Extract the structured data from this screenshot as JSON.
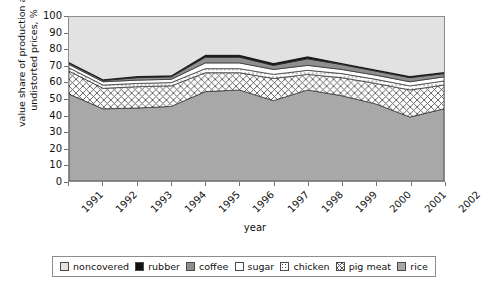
{
  "chart_data": {
    "type": "area",
    "stacked": true,
    "title": "",
    "xlabel": "year",
    "ylabel": "value share of production at undistorted prices, %",
    "categories": [
      "1991",
      "1992",
      "1993",
      "1994",
      "1995",
      "1996",
      "1997",
      "1998",
      "1999",
      "2000",
      "2001",
      "2002"
    ],
    "ylim": [
      0,
      100
    ],
    "yticks": [
      0,
      10,
      20,
      30,
      40,
      50,
      60,
      70,
      80,
      90,
      100
    ],
    "grid": false,
    "legend_position": "bottom",
    "stack_order_bottom_to_top": [
      "rice",
      "pig meat",
      "chicken",
      "sugar",
      "coffee",
      "rubber",
      "noncovered"
    ],
    "series": [
      {
        "name": "rice",
        "color": "#a8a8a8",
        "pattern": "solid-gray",
        "values": [
          53.0,
          44.0,
          44.5,
          45.5,
          54.5,
          55.5,
          49.0,
          55.5,
          52.0,
          47.0,
          39.0,
          44.0
        ]
      },
      {
        "name": "pig meat",
        "color": "#ffffff",
        "pattern": "cross-hatch",
        "values": [
          14.0,
          12.5,
          13.0,
          12.5,
          11.5,
          10.5,
          13.5,
          9.5,
          11.0,
          12.5,
          16.5,
          14.5
        ]
      },
      {
        "name": "chicken",
        "color": "#ffffff",
        "pattern": "dots",
        "values": [
          2.0,
          2.0,
          2.0,
          2.0,
          2.5,
          2.5,
          2.5,
          2.5,
          2.5,
          2.5,
          2.5,
          2.5
        ]
      },
      {
        "name": "sugar",
        "color": "#ffffff",
        "pattern": "plain",
        "values": [
          2.0,
          2.0,
          2.0,
          2.0,
          3.5,
          3.5,
          3.0,
          3.0,
          2.5,
          2.5,
          2.5,
          2.5
        ]
      },
      {
        "name": "coffee",
        "color": "#8f8f8f",
        "pattern": "solid-gray",
        "values": [
          0.8,
          0.8,
          1.5,
          1.5,
          3.5,
          3.5,
          2.5,
          4.0,
          3.0,
          2.5,
          2.5,
          2.0
        ]
      },
      {
        "name": "rubber",
        "color": "#1a1a1a",
        "pattern": "solid-black",
        "values": [
          0.7,
          0.7,
          1.0,
          1.0,
          1.5,
          1.5,
          1.5,
          1.5,
          1.0,
          1.0,
          1.0,
          1.0
        ]
      },
      {
        "name": "noncovered",
        "color": "#e2e2e2",
        "pattern": "light-gray",
        "values": [
          27.5,
          38.0,
          36.0,
          35.5,
          23.0,
          23.0,
          28.0,
          24.0,
          28.0,
          32.0,
          36.0,
          33.5
        ]
      }
    ],
    "cumulative_tops": {
      "rice": [
        53.0,
        44.0,
        44.5,
        45.5,
        54.5,
        55.5,
        49.0,
        55.5,
        52.0,
        47.0,
        39.0,
        44.0
      ],
      "pig meat": [
        67.0,
        56.5,
        57.5,
        58.0,
        66.0,
        66.0,
        62.5,
        65.0,
        63.0,
        59.5,
        55.5,
        58.5
      ],
      "chicken": [
        69.0,
        58.5,
        59.5,
        60.0,
        68.5,
        68.5,
        65.0,
        67.5,
        65.5,
        62.0,
        58.0,
        61.0
      ],
      "sugar": [
        71.0,
        60.5,
        61.5,
        62.0,
        72.0,
        72.0,
        68.0,
        70.5,
        68.0,
        64.5,
        60.5,
        63.5
      ],
      "coffee": [
        71.8,
        61.3,
        63.0,
        63.5,
        75.5,
        75.5,
        70.5,
        74.5,
        71.0,
        67.0,
        63.0,
        65.5
      ],
      "rubber": [
        72.5,
        62.0,
        64.0,
        64.5,
        77.0,
        77.0,
        72.0,
        76.0,
        72.0,
        68.0,
        64.0,
        66.5
      ],
      "noncovered": [
        100,
        100,
        100,
        100,
        100,
        100,
        100,
        100,
        100,
        100,
        100,
        100
      ]
    }
  },
  "axes": {
    "y_title": "value share of production at undistorted prices, %",
    "y_labels": [
      "100",
      "90",
      "80",
      "70",
      "60",
      "50",
      "40",
      "30",
      "20",
      "10",
      "0"
    ],
    "x_title": "year",
    "x_labels": [
      "1991",
      "1992",
      "1993",
      "1994",
      "1995",
      "1996",
      "1997",
      "1998",
      "1999",
      "2000",
      "2001",
      "2002"
    ]
  },
  "legend": {
    "items": [
      {
        "label": "noncovered",
        "swatch": "light-gray-swatch"
      },
      {
        "label": "rubber",
        "swatch": "black-swatch"
      },
      {
        "label": "coffee",
        "swatch": "mid-gray-swatch"
      },
      {
        "label": "sugar",
        "swatch": "white-swatch"
      },
      {
        "label": "chicken",
        "swatch": "dotted-swatch"
      },
      {
        "label": "pig meat",
        "swatch": "cross-hatch-swatch"
      },
      {
        "label": "rice",
        "swatch": "gray-swatch"
      }
    ]
  }
}
